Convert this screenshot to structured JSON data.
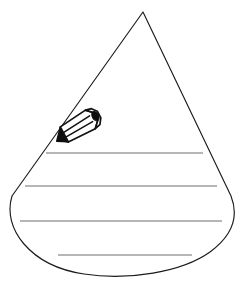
{
  "page": {
    "title": "Water Drop Writing Template",
    "background_color": "#ffffff",
    "width": 243,
    "height": 299
  },
  "shape": {
    "name": "teardrop-outline",
    "description": "Water drop / teardrop coloring outline",
    "stroke_color": "#1b1b1b",
    "fill_color": "#ffffff",
    "stroke_width": 1.15,
    "apex_x": 143,
    "apex_y": 12,
    "left_extreme_x": 11,
    "right_extreme_x": 232,
    "widest_y": 202,
    "bottom_y": 275,
    "path": "M143,12 L12,196 C2,228 30,266 84,274 C128,281 182,272 210,252 C236,233 238,214 231,196 Z"
  },
  "writing_lines": {
    "count": 4,
    "stroke_color": "#6f6f6f",
    "stroke_width": 1.15,
    "lines": [
      {
        "label": "writing-line-1",
        "x1": 46,
        "y1": 153,
        "x2": 203,
        "y2": 153
      },
      {
        "label": "writing-line-2",
        "x1": 25,
        "y1": 186,
        "x2": 217,
        "y2": 186
      },
      {
        "label": "writing-line-3",
        "x1": 20,
        "y1": 221,
        "x2": 222,
        "y2": 221
      },
      {
        "label": "writing-line-4",
        "x1": 58,
        "y1": 255,
        "x2": 192,
        "y2": 255
      }
    ]
  },
  "pencil": {
    "name": "pencil-icon",
    "description": "Small three-dimensional hexagonal pencil drawn inside the drop, angled up to the right",
    "outline_color": "#111111",
    "fill_color": "#ffffff",
    "accent_color": "#0d0d0d",
    "center_x": 78,
    "center_y": 126,
    "angle_degrees": -28
  },
  "icons": {
    "pencil": "pencil-icon",
    "drop": "water-drop-icon"
  },
  "labels": {
    "alt_text": "Blank water drop shape with four writing lines and a pencil illustration"
  }
}
